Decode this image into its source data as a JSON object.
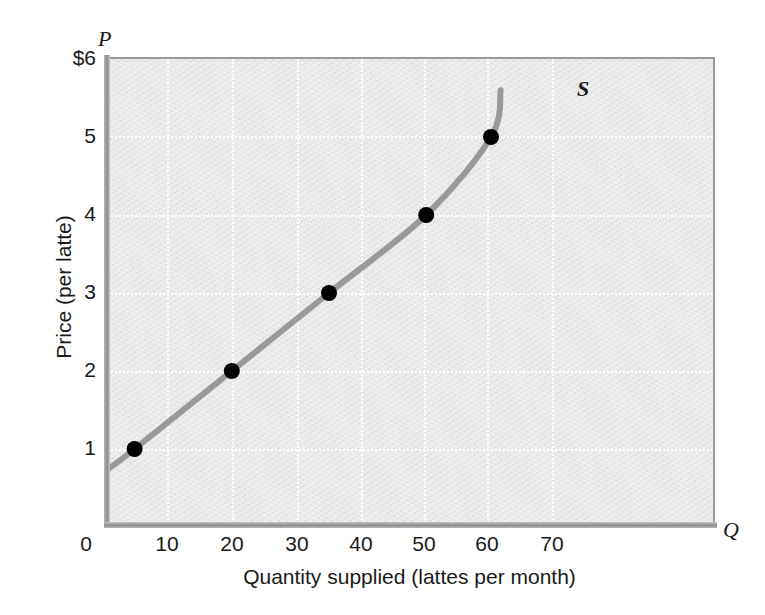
{
  "chart_data": {
    "type": "line",
    "title": "",
    "subtitle": "",
    "xlabel": "Quantity supplied (lattes per month)",
    "ylabel": "Price (per latte)",
    "x_axis_letter": "Q",
    "y_axis_letter": "P",
    "curve_label": "S",
    "xlim": [
      0,
      75
    ],
    "ylim": [
      0,
      6
    ],
    "xticks": [
      0,
      10,
      20,
      30,
      40,
      50,
      60,
      70
    ],
    "xtick_labels": [
      "0",
      "10",
      "20",
      "30",
      "40",
      "50",
      "60",
      "70"
    ],
    "yticks": [
      1,
      2,
      3,
      4,
      5,
      6
    ],
    "ytick_labels": [
      "1",
      "2",
      "3",
      "4",
      "5",
      "$6"
    ],
    "grid": true,
    "grid_color": "#ffffff",
    "legend_position": "none",
    "series": [
      {
        "name": "S",
        "label": "Supply curve",
        "color": "#999999",
        "marker_color": "#000000",
        "x": [
          5,
          20,
          35,
          50,
          60
        ],
        "y": [
          1,
          2,
          3,
          4,
          5
        ],
        "points": [
          {
            "quantity": 5,
            "price": 1
          },
          {
            "quantity": 20,
            "price": 2
          },
          {
            "quantity": 35,
            "price": 3
          },
          {
            "quantity": 50,
            "price": 4
          },
          {
            "quantity": 60,
            "price": 5
          }
        ],
        "curve_start": {
          "quantity": 1,
          "price": 0.75
        },
        "curve_end": {
          "quantity": 61.5,
          "price": 5.6
        }
      }
    ],
    "plot_background": "#e9e9e9",
    "axis_color": "#8d8d8d"
  },
  "axes": {
    "x_letter": "Q",
    "y_letter": "P",
    "x_title": "Quantity supplied (lattes per month)",
    "y_title": "Price (per latte)"
  },
  "curve": {
    "label": "S"
  }
}
